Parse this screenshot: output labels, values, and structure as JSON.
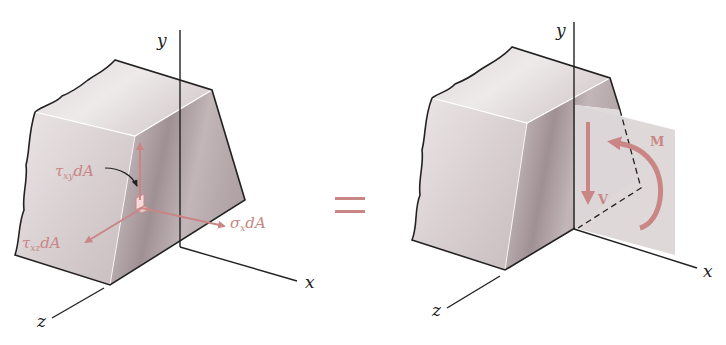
{
  "colors": {
    "force": "#c98684",
    "edge": "#222222",
    "solid_light": "#e6dfe0",
    "solid_mid": "#cfc4c6",
    "solid_dark": "#a89a9d",
    "plane": "#ddd6d7"
  },
  "left_figure": {
    "axes": {
      "y": "y",
      "x": "x",
      "z": "z"
    },
    "labels": {
      "tau_xy": {
        "sym": "τ",
        "sub": "xy",
        "tail": "dA"
      },
      "tau_xz": {
        "sym": "τ",
        "sub": "xz",
        "tail": "dA"
      },
      "sigma_x": {
        "sym": "σ",
        "sub": "x",
        "tail": "dA"
      }
    }
  },
  "equals": "=",
  "right_figure": {
    "axes": {
      "y": "y",
      "x": "x",
      "z": "z"
    },
    "labels": {
      "shear": "V",
      "moment": "M"
    }
  }
}
